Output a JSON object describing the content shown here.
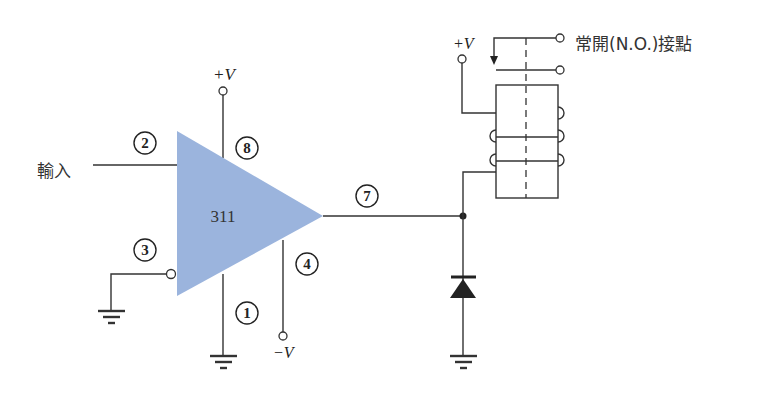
{
  "diagram": {
    "comparator": {
      "label": "311",
      "fill_color": "#9bb4dd"
    },
    "pins": {
      "in_plus": "2",
      "in_minus": "3",
      "vplus": "8",
      "output": "7",
      "vminus": "4",
      "gnd": "1"
    },
    "labels": {
      "input": "輸入",
      "vplus_chip": "+V",
      "vminus_chip": "−V",
      "vplus_relay": "+V",
      "contact": "常開(N.O.)接點"
    },
    "components": [
      "comparator-311",
      "relay",
      "diode",
      "ground-x3"
    ]
  }
}
